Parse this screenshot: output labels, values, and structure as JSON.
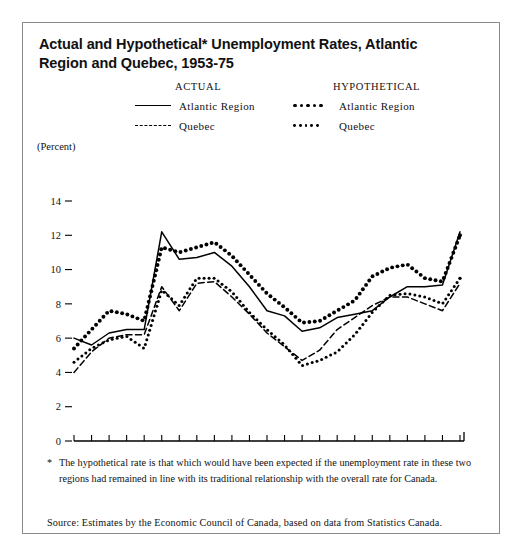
{
  "figure": {
    "title": "Actual and Hypothetical* Unemployment Rates, Atlantic Region and Quebec, 1953-75",
    "footnote_marker": "*",
    "footnote": "The hypothetical rate is that which would have been expected if the unemployment rate in these two regions had remained in line with its traditional relationship with the overall rate for Canada.",
    "source": "Source: Estimates by the Economic Council of Canada, based on data from Statistics Canada."
  },
  "legend": {
    "actual_heading": "ACTUAL",
    "hypothetical_heading": "HYPOTHETICAL",
    "actual_atlantic": "Atlantic Region",
    "actual_quebec": "Quebec",
    "hypo_atlantic": "Atlantic Region",
    "hypo_quebec": "Quebec"
  },
  "chart_data": {
    "type": "line",
    "title": "Actual and Hypothetical* Unemployment Rates, Atlantic Region and Quebec, 1953-75",
    "xlabel": "",
    "ylabel": "(Percent)",
    "xlim": [
      1953,
      1975
    ],
    "ylim": [
      0,
      14
    ],
    "yticks": [
      0,
      2,
      4,
      6,
      8,
      10,
      12,
      14
    ],
    "ytick_labels": [
      "0",
      "2",
      "4",
      "6",
      "8",
      "10",
      "12",
      "14"
    ],
    "xticks": [
      1953,
      1954,
      1955,
      1956,
      1957,
      1958,
      1959,
      1960,
      1961,
      1962,
      1963,
      1964,
      1965,
      1966,
      1967,
      1968,
      1969,
      1970,
      1971,
      1972,
      1973,
      1974,
      1975
    ],
    "xtick_labels_shown": [
      "1953",
      "1955",
      "1960",
      "1965",
      "1970",
      "1975"
    ],
    "grid": false,
    "legend_position": "top",
    "x": [
      1953,
      1954,
      1955,
      1956,
      1957,
      1958,
      1959,
      1960,
      1961,
      1962,
      1963,
      1964,
      1965,
      1966,
      1967,
      1968,
      1969,
      1970,
      1971,
      1972,
      1973,
      1974,
      1975
    ],
    "series": [
      {
        "name": "Atlantic Region",
        "kind": "actual",
        "style": "solid",
        "values": [
          6.0,
          5.6,
          6.3,
          6.5,
          6.5,
          12.2,
          10.6,
          10.7,
          11.0,
          10.2,
          9.0,
          7.6,
          7.3,
          6.4,
          6.6,
          7.2,
          7.4,
          7.6,
          8.4,
          9.0,
          9.0,
          9.1,
          12.2
        ]
      },
      {
        "name": "Quebec",
        "kind": "actual",
        "style": "dashed",
        "values": [
          4.0,
          5.2,
          6.0,
          6.2,
          6.2,
          9.0,
          7.6,
          9.2,
          9.3,
          8.4,
          7.4,
          6.3,
          5.5,
          4.7,
          5.3,
          6.5,
          7.2,
          7.9,
          8.4,
          8.4,
          8.0,
          7.6,
          9.2
        ]
      },
      {
        "name": "Atlantic Region",
        "kind": "hypothetical",
        "style": "dots-large",
        "values": [
          5.4,
          6.5,
          7.6,
          7.4,
          7.0,
          11.3,
          11.0,
          11.3,
          11.6,
          10.8,
          9.7,
          8.6,
          7.8,
          6.9,
          7.0,
          7.6,
          8.2,
          9.6,
          10.1,
          10.3,
          9.5,
          9.3,
          12.0
        ]
      },
      {
        "name": "Quebec",
        "kind": "hypothetical",
        "style": "dots-small",
        "values": [
          4.6,
          5.4,
          5.9,
          6.1,
          5.4,
          8.8,
          7.9,
          9.5,
          9.5,
          8.7,
          7.5,
          6.5,
          5.6,
          4.4,
          4.7,
          5.2,
          6.2,
          7.5,
          8.5,
          8.6,
          8.4,
          8.0,
          9.5
        ]
      }
    ]
  }
}
